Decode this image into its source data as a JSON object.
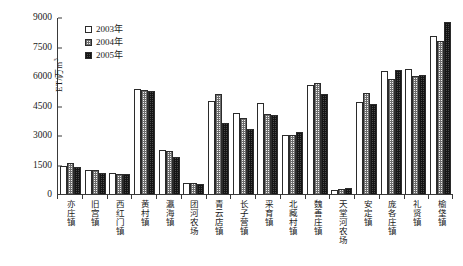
{
  "chart_data": {
    "type": "bar",
    "title": "",
    "xlabel": "",
    "ylabel": "ET/万m³",
    "ylabel_base": "ET/万m",
    "ylabel_sup": "3",
    "ylim": [
      0,
      9000
    ],
    "yticks": [
      0,
      1500,
      3000,
      4500,
      6000,
      7500,
      9000
    ],
    "ytick_labels": [
      "0",
      "1500",
      "3000",
      "4500",
      "6000",
      "7500",
      "9000"
    ],
    "grid": false,
    "legend_position": "upper-left-inside",
    "categories": [
      "亦庄镇",
      "旧宫镇",
      "西红门镇",
      "黄村镇",
      "瀛海镇",
      "团河农场",
      "青云店镇",
      "长子营镇",
      "采育镇",
      "北臧村镇",
      "魏善庄镇",
      "天堂河农场",
      "安定镇",
      "庞各庄镇",
      "礼贤镇",
      "榆垡镇"
    ],
    "series": [
      {
        "name": "2003年",
        "values": [
          1430,
          1220,
          1090,
          5350,
          2230,
          560,
          4750,
          4130,
          4630,
          3000,
          5530,
          210,
          4660,
          6250,
          6340,
          8030
        ]
      },
      {
        "name": "2004年",
        "values": [
          1600,
          1230,
          1010,
          5280,
          2180,
          540,
          5080,
          3880,
          4080,
          3010,
          5620,
          250,
          5160,
          5830,
          6010,
          7780
        ]
      },
      {
        "name": "2005年",
        "values": [
          1390,
          1060,
          1000,
          5230,
          1870,
          520,
          3610,
          3310,
          4020,
          3150,
          5070,
          300,
          4590,
          6320,
          6070,
          8730
        ]
      }
    ]
  },
  "legend": {
    "items": [
      {
        "label": "2003年",
        "key": "y2003",
        "color": "#ffffff"
      },
      {
        "label": "2004年",
        "key": "y2004",
        "color": "#f2f2f2"
      },
      {
        "label": "2005年",
        "key": "y2005",
        "color": "#4a4a4a"
      }
    ]
  }
}
